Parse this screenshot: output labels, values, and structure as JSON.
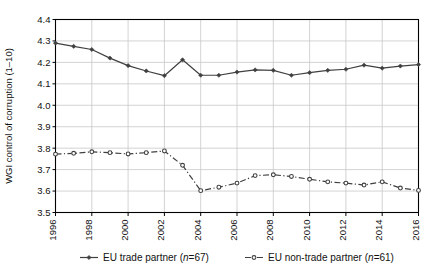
{
  "chart_data": {
    "type": "line",
    "title": "",
    "xlabel": "",
    "ylabel": "WGI control of corruption (1–10)",
    "x": [
      1996,
      1997,
      1998,
      1999,
      2000,
      2001,
      2002,
      2003,
      2004,
      2005,
      2006,
      2007,
      2008,
      2009,
      2010,
      2011,
      2012,
      2013,
      2014,
      2015,
      2016
    ],
    "xlim": [
      1996,
      2016
    ],
    "ylim": [
      3.5,
      4.4
    ],
    "xticks": [
      1996,
      1998,
      2000,
      2002,
      2004,
      2006,
      2008,
      2010,
      2012,
      2014,
      2016
    ],
    "xtick_labels": [
      "1996",
      "1998",
      "2000",
      "2002",
      "2004",
      "2006",
      "2008",
      "2010",
      "2012",
      "2014",
      "2016"
    ],
    "yticks": [
      3.5,
      3.6,
      3.7,
      3.8,
      3.9,
      4.0,
      4.1,
      4.2,
      4.3,
      4.4
    ],
    "ytick_labels": [
      "3.5",
      "3.6",
      "3.7",
      "3.8",
      "3.9",
      "4.0",
      "4.1",
      "4.2",
      "4.3",
      "4.4"
    ],
    "grid": true,
    "grid_axis": "both",
    "legend_position": "below",
    "series": [
      {
        "name": "EU trade partner (n=67)",
        "legend_text_main": "EU trade partner (",
        "legend_text_italic": "n",
        "legend_text_tail": "=67)",
        "style": "solid",
        "marker": "diamond",
        "color": "#404040",
        "values": [
          4.29,
          4.275,
          4.26,
          4.22,
          4.185,
          4.16,
          4.138,
          4.212,
          4.14,
          4.14,
          4.155,
          4.165,
          4.163,
          4.14,
          4.152,
          4.163,
          4.168,
          4.187,
          4.173,
          4.183,
          4.19
        ]
      },
      {
        "name": "EU non-trade partner (n=61)",
        "legend_text_main": "EU non-trade partner (",
        "legend_text_italic": "n",
        "legend_text_tail": "=61)",
        "style": "dashdot",
        "marker": "circle",
        "color": "#404040",
        "values": [
          3.772,
          3.776,
          3.783,
          3.779,
          3.773,
          3.779,
          3.787,
          3.72,
          3.602,
          3.618,
          3.637,
          3.672,
          3.676,
          3.668,
          3.655,
          3.643,
          3.637,
          3.628,
          3.643,
          3.614,
          3.603
        ]
      }
    ]
  },
  "legend": {
    "items": [
      {
        "label": "EU trade partner (n=67)",
        "style": "solid",
        "marker": "diamond"
      },
      {
        "label": "EU non-trade partner (n=61)",
        "style": "dashdot",
        "marker": "circle"
      }
    ]
  },
  "colors": {
    "line": "#404040",
    "grid": "#c8c8c8",
    "axis": "#000000",
    "background": "#ffffff"
  }
}
